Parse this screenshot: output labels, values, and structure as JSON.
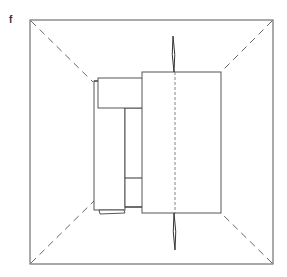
{
  "figure": {
    "panel_label": "f",
    "colors": {
      "line": "#444444",
      "background": "#ffffff"
    }
  }
}
